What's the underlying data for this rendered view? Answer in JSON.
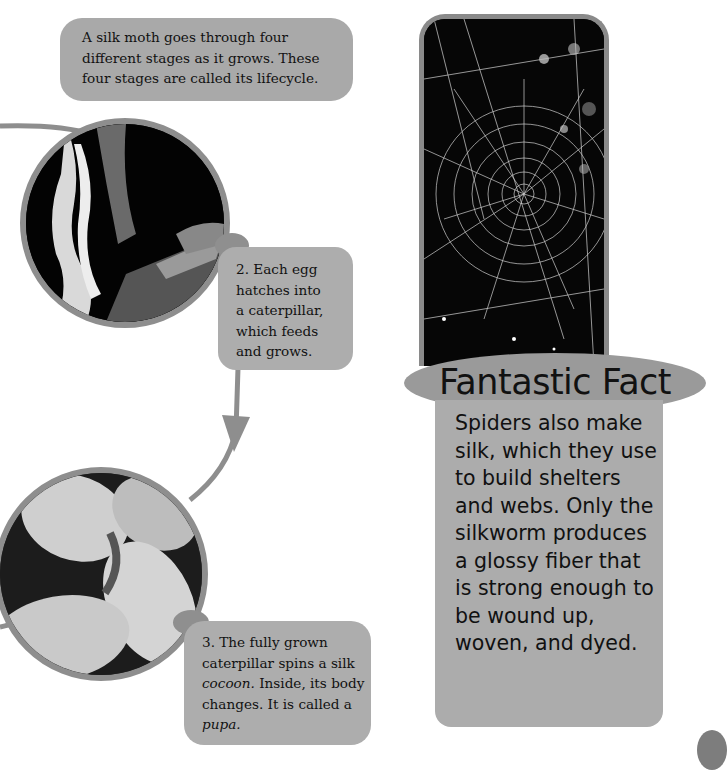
{
  "intro": {
    "text": "A silk moth goes through four different stages as it grows. These four stages are called its lifecycle."
  },
  "stages": [
    {
      "number": "2.",
      "image": "eggs-and-caterpillar-photo",
      "caption_lines": [
        "2. Each egg",
        "hatches into",
        "a caterpillar,",
        "which feeds",
        "and grows."
      ]
    },
    {
      "number": "3.",
      "image": "silk-cocoons-photo",
      "caption_parts": [
        {
          "text": "3. The fully grown caterpillar spins a silk ",
          "italic": false
        },
        {
          "text": "cocoon.",
          "italic": true
        },
        {
          "text": " Inside, its body changes. It is called a ",
          "italic": false
        },
        {
          "text": "pupa.",
          "italic": true
        }
      ]
    }
  ],
  "fact": {
    "image": "spider-web-photo",
    "title": "Fantastic Fact",
    "body": "Spiders also make silk, which they use to build shelters and webs. Only the silkworm produces a glossy fiber that is strong enough to be wound up, woven, and dyed."
  },
  "colors": {
    "box_gray": "#a9a9a9",
    "border_gray": "#8e8e8e",
    "title_oval": "#9a9a9a",
    "text": "#111111"
  }
}
